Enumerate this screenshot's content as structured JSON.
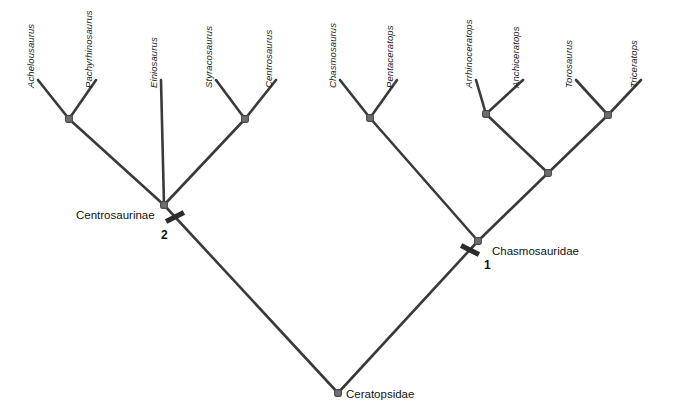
{
  "figure": {
    "type": "cladogram",
    "background_color": "#ffffff",
    "branch_color": "#3a3a3a",
    "node_color": "#6e6e6e",
    "tick_color": "#2b2b2b",
    "text_color": "#1a1a1a"
  },
  "taxa": [
    {
      "name": "Achelousaurus",
      "x": 38,
      "y": 80,
      "label_x": 36,
      "label_y": 77
    },
    {
      "name": "Pachyrhinosaurus",
      "x": 96,
      "y": 80,
      "label_x": 94,
      "label_y": 77
    },
    {
      "name": "Einiosaurus",
      "x": 161,
      "y": 80,
      "label_x": 159,
      "label_y": 77
    },
    {
      "name": "Styracosaurus",
      "x": 216,
      "y": 80,
      "label_x": 214,
      "label_y": 77
    },
    {
      "name": "Centrosaurus",
      "x": 276,
      "y": 80,
      "label_x": 274,
      "label_y": 77
    },
    {
      "name": "Chasmosaurus",
      "x": 340,
      "y": 80,
      "label_x": 338,
      "label_y": 77
    },
    {
      "name": "Pentaceratops",
      "x": 397,
      "y": 80,
      "label_x": 395,
      "label_y": 77
    },
    {
      "name": "Arrhinoceratops",
      "x": 476,
      "y": 80,
      "label_x": 474,
      "label_y": 77
    },
    {
      "name": "Anchiceratops",
      "x": 523,
      "y": 80,
      "label_x": 521,
      "label_y": 77
    },
    {
      "name": "Torosaurus",
      "x": 576,
      "y": 80,
      "label_x": 574,
      "label_y": 77
    },
    {
      "name": "Triceratops",
      "x": 641,
      "y": 80,
      "label_x": 639,
      "label_y": 77
    }
  ],
  "internal_nodes": [
    {
      "id": "n-achelo-pachy",
      "x": 69,
      "y": 119
    },
    {
      "id": "n-styra-centro",
      "x": 245,
      "y": 119
    },
    {
      "id": "n-centrosaurinae",
      "x": 164,
      "y": 205
    },
    {
      "id": "n-chasmo-penta",
      "x": 370,
      "y": 118
    },
    {
      "id": "n-arrhino-anchi",
      "x": 486,
      "y": 114
    },
    {
      "id": "n-toro-tri",
      "x": 608,
      "y": 115
    },
    {
      "id": "n-triceratopsini",
      "x": 548,
      "y": 173
    },
    {
      "id": "n-chasmosauridae",
      "x": 478,
      "y": 241
    },
    {
      "id": "n-ceratopsidae",
      "x": 338,
      "y": 393
    }
  ],
  "branches": [
    {
      "from_x": 38,
      "from_y": 80,
      "to_x": 69,
      "to_y": 119
    },
    {
      "from_x": 96,
      "from_y": 80,
      "to_x": 69,
      "to_y": 119
    },
    {
      "from_x": 69,
      "from_y": 119,
      "to_x": 164,
      "to_y": 205
    },
    {
      "from_x": 161,
      "from_y": 80,
      "to_x": 164,
      "to_y": 205
    },
    {
      "from_x": 216,
      "from_y": 80,
      "to_x": 245,
      "to_y": 119
    },
    {
      "from_x": 276,
      "from_y": 80,
      "to_x": 245,
      "to_y": 119
    },
    {
      "from_x": 245,
      "from_y": 119,
      "to_x": 164,
      "to_y": 205
    },
    {
      "from_x": 164,
      "from_y": 205,
      "to_x": 338,
      "to_y": 393
    },
    {
      "from_x": 340,
      "from_y": 80,
      "to_x": 370,
      "to_y": 118
    },
    {
      "from_x": 397,
      "from_y": 80,
      "to_x": 370,
      "to_y": 118
    },
    {
      "from_x": 370,
      "from_y": 118,
      "to_x": 478,
      "to_y": 241
    },
    {
      "from_x": 476,
      "from_y": 80,
      "to_x": 486,
      "to_y": 114
    },
    {
      "from_x": 523,
      "from_y": 80,
      "to_x": 486,
      "to_y": 114
    },
    {
      "from_x": 576,
      "from_y": 80,
      "to_x": 608,
      "to_y": 115
    },
    {
      "from_x": 641,
      "from_y": 80,
      "to_x": 608,
      "to_y": 115
    },
    {
      "from_x": 486,
      "from_y": 114,
      "to_x": 548,
      "to_y": 173
    },
    {
      "from_x": 608,
      "from_y": 115,
      "to_x": 548,
      "to_y": 173
    },
    {
      "from_x": 548,
      "from_y": 173,
      "to_x": 478,
      "to_y": 241
    },
    {
      "from_x": 478,
      "from_y": 241,
      "to_x": 338,
      "to_y": 393
    }
  ],
  "clade_labels": [
    {
      "text": "Centrosaurinae",
      "x": 76,
      "y": 209,
      "anchor": "left"
    },
    {
      "text": "Chasmosauridae",
      "x": 492,
      "y": 245,
      "anchor": "left"
    },
    {
      "text": "Ceratopsidae",
      "x": 346,
      "y": 388,
      "anchor": "left"
    }
  ],
  "character_ticks": [
    {
      "number": "2",
      "x": 175,
      "y": 217,
      "angle": 63,
      "num_x": 161,
      "num_y": 228
    },
    {
      "number": "1",
      "x": 470,
      "y": 250,
      "angle": -63,
      "num_x": 484,
      "num_y": 258
    }
  ],
  "bottom_caption": {
    "text": "."
  }
}
